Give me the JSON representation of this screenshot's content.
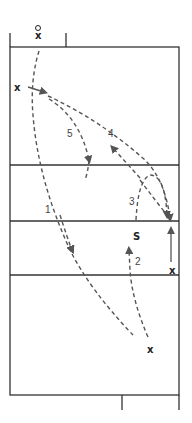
{
  "diagram": {
    "type": "volleyball-court-drill",
    "colors": {
      "line": "#333333",
      "path": "#555555",
      "text": "#222222"
    },
    "players": [
      {
        "id": "coach",
        "marker": "o/x",
        "x": 38,
        "y": 32
      },
      {
        "id": "x1",
        "label": "x",
        "x": 17,
        "y": 88
      },
      {
        "id": "setter",
        "label": "S",
        "x": 137,
        "y": 236
      },
      {
        "id": "x2",
        "label": "x",
        "x": 172,
        "y": 271
      },
      {
        "id": "x3",
        "label": "x",
        "x": 150,
        "y": 350
      }
    ],
    "path_labels": [
      {
        "label": "1",
        "x": 46,
        "y": 212
      },
      {
        "label": "2",
        "x": 137,
        "y": 264
      },
      {
        "label": "3",
        "x": 131,
        "y": 204
      },
      {
        "label": "4",
        "x": 110,
        "y": 136
      },
      {
        "label": "5",
        "x": 69,
        "y": 136
      }
    ]
  }
}
